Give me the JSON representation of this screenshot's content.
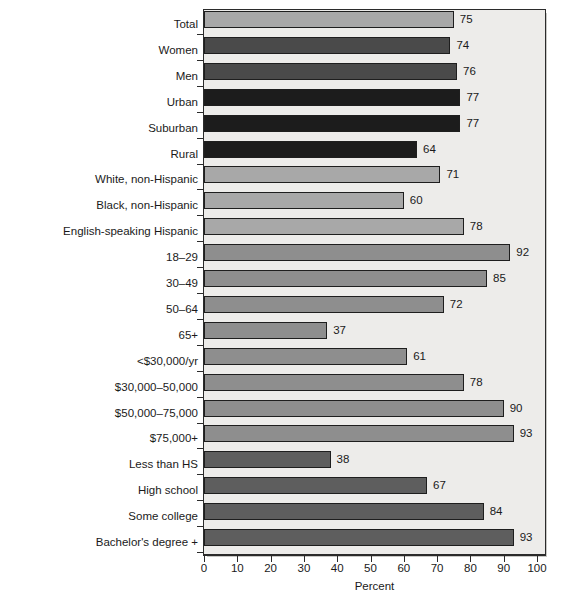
{
  "chart_data": {
    "type": "bar",
    "orientation": "horizontal",
    "title": "",
    "subtitle": "",
    "xlabel": "Percent",
    "ylabel": "",
    "xlim": [
      0,
      100
    ],
    "ylim": null,
    "grid": false,
    "legend": null,
    "xticks": [
      0,
      10,
      20,
      30,
      40,
      50,
      60,
      70,
      80,
      90,
      100
    ],
    "xtick_labels": [
      "0",
      "10",
      "20",
      "30",
      "40",
      "50",
      "60",
      "70",
      "80",
      "90",
      "100"
    ],
    "categories": [
      "Total",
      "Women",
      "Men",
      "Urban",
      "Suburban",
      "Rural",
      "White, non-Hispanic",
      "Black, non-Hispanic",
      "English-speaking Hispanic",
      "18–29",
      "30–49",
      "50–64",
      "65+",
      "<$30,000/yr",
      "$30,000–50,000",
      "$50,000–75,000",
      "$75,000+",
      "Less than HS",
      "High school",
      "Some college",
      "Bachelor's degree +"
    ],
    "values": [
      75,
      74,
      76,
      77,
      77,
      64,
      71,
      60,
      78,
      92,
      85,
      72,
      37,
      61,
      78,
      90,
      93,
      38,
      67,
      84,
      93
    ],
    "value_labels": [
      "75",
      "74",
      "76",
      "77",
      "77",
      "64",
      "71",
      "60",
      "78",
      "92",
      "85",
      "72",
      "37",
      "61",
      "78",
      "90",
      "93",
      "38",
      "67",
      "84",
      "93"
    ],
    "bar_colors": [
      "#a8a8a8",
      "#4a4a4a",
      "#4a4a4a",
      "#1c1c1c",
      "#1c1c1c",
      "#1c1c1c",
      "#a8a8a8",
      "#a8a8a8",
      "#a8a8a8",
      "#8e8e8e",
      "#8e8e8e",
      "#8e8e8e",
      "#8e8e8e",
      "#8e8e8e",
      "#8e8e8e",
      "#8e8e8e",
      "#8e8e8e",
      "#5e5e5e",
      "#5e5e5e",
      "#5e5e5e",
      "#5e5e5e"
    ],
    "groups": [
      {
        "name": "Total",
        "categories": [
          "Total"
        ]
      },
      {
        "name": "Gender",
        "categories": [
          "Women",
          "Men"
        ]
      },
      {
        "name": "Community type",
        "categories": [
          "Urban",
          "Suburban",
          "Rural"
        ]
      },
      {
        "name": "Race/ethnicity",
        "categories": [
          "White, non-Hispanic",
          "Black, non-Hispanic",
          "English-speaking Hispanic"
        ]
      },
      {
        "name": "Age",
        "categories": [
          "18–29",
          "30–49",
          "50–64",
          "65+"
        ]
      },
      {
        "name": "Household income",
        "categories": [
          "<$30,000/yr",
          "$30,000–50,000",
          "$50,000–75,000",
          "$75,000+"
        ]
      },
      {
        "name": "Education",
        "categories": [
          "Less than HS",
          "High school",
          "Some college",
          "Bachelor's degree +"
        ]
      }
    ]
  },
  "style": {
    "plot_background": "#edecea",
    "axis_color": "#2b2b2b",
    "text_color": "#1a1a1a",
    "bar_outline": "#1e1e1e",
    "shadow_color": "#9a9a96"
  },
  "footnote": {
    "text": ""
  }
}
